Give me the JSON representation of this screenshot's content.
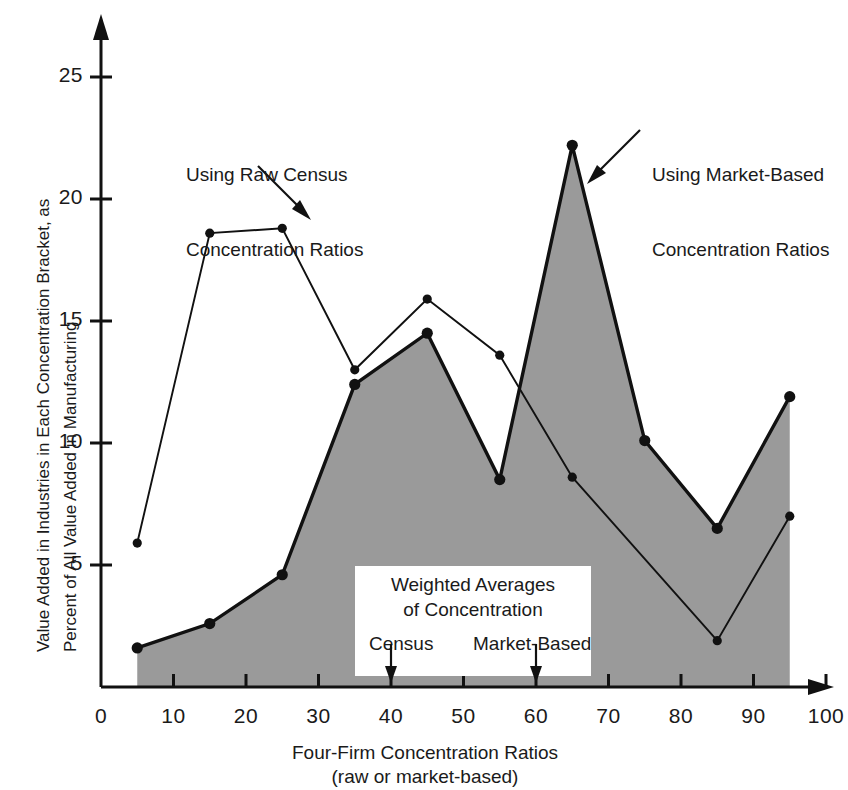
{
  "chart_data": {
    "type": "line",
    "title": "",
    "xlabel": "Four-Firm Concentration Ratios",
    "xlabel_sub": "(raw or market-based)",
    "ylabel_line1": "Value Added in Industries in Each Concentration Bracket, as",
    "ylabel_line2": "Percent of All Value Added in Manufacturing",
    "xlim": [
      0,
      100
    ],
    "ylim": [
      0,
      27
    ],
    "xticks": [
      0,
      10,
      20,
      30,
      40,
      50,
      60,
      70,
      80,
      90,
      100
    ],
    "yticks": [
      5,
      10,
      15,
      20,
      25
    ],
    "grid": false,
    "legend": "annotations",
    "x": [
      5,
      15,
      25,
      35,
      45,
      55,
      65,
      75,
      85,
      95
    ],
    "series": [
      {
        "name": "Using Raw Census Concentration Ratios",
        "key": "census",
        "filled": false,
        "values": [
          5.9,
          18.6,
          18.8,
          13.0,
          15.9,
          13.6,
          8.6,
          null,
          1.9,
          7.0
        ]
      },
      {
        "name": "Using Market-Based Concentration Ratios",
        "key": "market",
        "filled": true,
        "fill_color": "#9a9a9a",
        "values": [
          1.6,
          2.6,
          4.6,
          12.4,
          14.5,
          8.5,
          22.2,
          10.1,
          6.5,
          11.9
        ]
      }
    ],
    "annotations": [
      {
        "name": "census-annotation",
        "line1": "Using Raw Census",
        "line2": "Concentration Ratios"
      },
      {
        "name": "market-annotation",
        "line1": "Using Market-Based",
        "line2": "Concentration Ratios"
      }
    ],
    "inset": {
      "title_line1": "Weighted Averages",
      "title_line2": "of Concentration",
      "markers": [
        {
          "label": "Census",
          "value": 40
        },
        {
          "label": "Market-Based",
          "value": 60
        }
      ]
    }
  }
}
